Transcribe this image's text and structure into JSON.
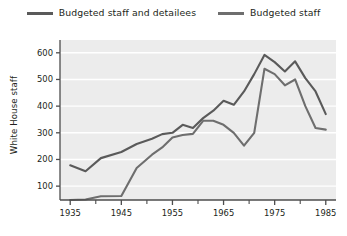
{
  "chart_data": {
    "type": "line",
    "title": "",
    "xlabel": "",
    "ylabel": "White House staff",
    "xlim": [
      1933,
      1987
    ],
    "ylim": [
      48,
      648
    ],
    "grid": "horizontal",
    "legend_position": "top-center",
    "xticks_major": [
      1935,
      1945,
      1955,
      1965,
      1975,
      1985
    ],
    "xticks_minor": [
      1940,
      1950,
      1960,
      1970,
      1980
    ],
    "yticks": [
      100,
      200,
      300,
      400,
      500,
      600
    ],
    "colors": {
      "series1": "#5a5a5a",
      "series2": "#6e6e6e",
      "plot_background": "#ececec",
      "gridline": "#ffffff",
      "axis": "#4d4d4d",
      "text": "#231f20"
    },
    "series": [
      {
        "name": "Budgeted staff and detailees",
        "x": [
          1935,
          1938,
          1941,
          1945,
          1948,
          1951,
          1953,
          1955,
          1957,
          1959,
          1961,
          1963,
          1965,
          1967,
          1969,
          1971,
          1973,
          1975,
          1977,
          1979,
          1981,
          1983,
          1985
        ],
        "values": [
          178,
          156,
          205,
          228,
          258,
          278,
          295,
          300,
          330,
          318,
          355,
          383,
          420,
          405,
          455,
          520,
          592,
          565,
          530,
          568,
          505,
          455,
          370
        ]
      },
      {
        "name": "Budgeted staff",
        "x": [
          1935,
          1938,
          1941,
          1945,
          1948,
          1951,
          1953,
          1955,
          1957,
          1959,
          1961,
          1963,
          1965,
          1967,
          1969,
          1971,
          1973,
          1975,
          1977,
          1979,
          1981,
          1983,
          1985
        ],
        "values": [
          48,
          50,
          62,
          63,
          168,
          218,
          245,
          282,
          292,
          296,
          345,
          345,
          330,
          300,
          252,
          300,
          540,
          520,
          478,
          500,
          400,
          318,
          312
        ]
      }
    ]
  },
  "legend": {
    "entries": [
      {
        "label": "Budgeted staff and detailees"
      },
      {
        "label": "Budgeted staff"
      }
    ]
  },
  "axes": {
    "ylabel": "White House staff",
    "ytick_labels": [
      "600",
      "500",
      "400",
      "300",
      "200",
      "100"
    ],
    "xtick_labels": [
      "1935",
      "1945",
      "1955",
      "1965",
      "1975",
      "1985"
    ]
  }
}
